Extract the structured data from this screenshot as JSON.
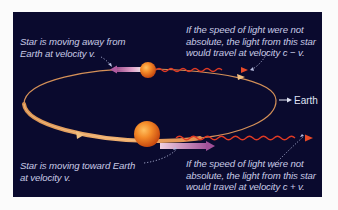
{
  "diagram": {
    "colors": {
      "background": "#0a0a2e",
      "orbit": "#e0a060",
      "star": "#f07a20",
      "light_wave": "#e83a20",
      "motion_arrow": "#c07ab0",
      "text": "#c9cbe6"
    },
    "captions": {
      "star_away": {
        "lines": [
          "Star is moving away from",
          "Earth at velocity v."
        ]
      },
      "light_away": {
        "lines": [
          "If the speed of light were not",
          "absolute, the light from this star",
          "would travel at velocity c − v."
        ]
      },
      "star_toward": {
        "lines": [
          "Star is moving toward  Earth",
          "at velocity v."
        ]
      },
      "light_toward": {
        "lines": [
          "If the speed of light were not",
          "absolute, the light from this star",
          "would travel at velocity c + v."
        ]
      }
    },
    "earth": {
      "label": "Earth",
      "icon": "arrow-right-icon"
    },
    "elements": [
      {
        "name": "orbit",
        "shape": "ellipse"
      },
      {
        "name": "star-far",
        "position": "top of orbit",
        "motion": "away from Earth"
      },
      {
        "name": "star-near",
        "position": "bottom of orbit",
        "motion": "toward Earth"
      },
      {
        "name": "light-wave-far",
        "direction": "toward Earth",
        "speed": "c − v"
      },
      {
        "name": "light-wave-near",
        "direction": "toward Earth",
        "speed": "c + v"
      }
    ]
  }
}
